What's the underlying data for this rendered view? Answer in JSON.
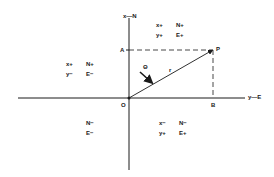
{
  "diagram": {
    "type": "coordinate-system",
    "axes": {
      "vertical_label": "x—N",
      "horizontal_label": "y—E"
    },
    "points": {
      "origin": "O",
      "a": "A",
      "p": "P",
      "b": "B"
    },
    "vector": {
      "length_label": "r",
      "angle_label": "Θ"
    },
    "quadrants": {
      "upper_left": {
        "row1": [
          "x+",
          "N+"
        ],
        "row2": [
          "y−",
          "E−"
        ]
      },
      "upper_right": {
        "row1": [
          "x+",
          "N+"
        ],
        "row2": [
          "y+",
          "E+"
        ]
      },
      "lower_left": {
        "row1": [
          "",
          "N−"
        ],
        "row2": [
          "",
          "E−"
        ]
      },
      "lower_right": {
        "row1": [
          "x−",
          "N−"
        ],
        "row2": [
          "y+",
          "E+"
        ]
      }
    },
    "colors": {
      "line": "#1a1a1a",
      "background": "#ffffff"
    }
  }
}
